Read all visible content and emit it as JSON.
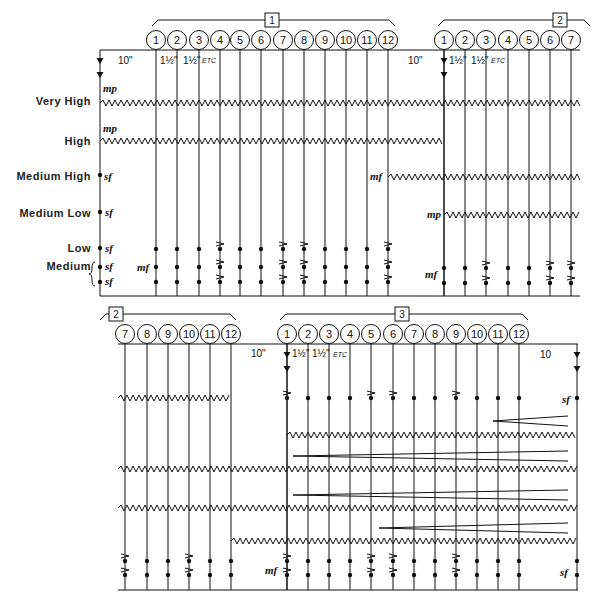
{
  "row_labels": [
    {
      "key": "very_high",
      "label": "Very High",
      "y": 101
    },
    {
      "key": "high",
      "label": "High",
      "y": 141
    },
    {
      "key": "medium_high",
      "label": "Medium High",
      "y": 176
    },
    {
      "key": "medium_low",
      "label": "Medium Low",
      "y": 213
    },
    {
      "key": "low",
      "label": "Low",
      "y": 248
    },
    {
      "key": "medium",
      "label": "Medium",
      "y": 266
    }
  ],
  "systems": [
    {
      "id": "top",
      "staff_top_y": 50,
      "staff_bottom_y": 296,
      "start_x": 100,
      "end_x": 580,
      "sections": [
        {
          "number": "1",
          "box_x": 272,
          "bracket_from": 152,
          "bracket_to": 395
        },
        {
          "number": "2",
          "box_x": 560,
          "bracket_from": 438,
          "bracket_to": 590
        }
      ],
      "events": [
        {
          "label": "1",
          "x": 156
        },
        {
          "label": "2",
          "x": 177
        },
        {
          "label": "3",
          "x": 199
        },
        {
          "label": "4",
          "x": 220
        },
        {
          "label": "5",
          "x": 240
        },
        {
          "label": "6",
          "x": 261
        },
        {
          "label": "7",
          "x": 283
        },
        {
          "label": "8",
          "x": 304
        },
        {
          "label": "9",
          "x": 325
        },
        {
          "label": "10",
          "x": 346
        },
        {
          "label": "11",
          "x": 367
        },
        {
          "label": "12",
          "x": 388
        },
        {
          "label": "1",
          "x": 444
        },
        {
          "label": "2",
          "x": 465
        },
        {
          "label": "3",
          "x": 486
        },
        {
          "label": "4",
          "x": 508
        },
        {
          "label": "5",
          "x": 529
        },
        {
          "label": "6",
          "x": 550
        },
        {
          "label": "7",
          "x": 571
        }
      ],
      "durations": [
        {
          "text": "10\"",
          "x": 118,
          "y": 64,
          "cls": "dur"
        },
        {
          "text": "1½\"",
          "x": 160,
          "y": 64,
          "cls": "dur"
        },
        {
          "text": "1½\"",
          "x": 183,
          "y": 64,
          "cls": "dur"
        },
        {
          "text": "ETC",
          "x": 202,
          "y": 63,
          "cls": "etc"
        },
        {
          "text": "10\"",
          "x": 408,
          "y": 64,
          "cls": "dur"
        },
        {
          "text": "1½\"",
          "x": 449,
          "y": 64,
          "cls": "dur"
        },
        {
          "text": "1½\"",
          "x": 471,
          "y": 64,
          "cls": "dur"
        },
        {
          "text": "ETC",
          "x": 491,
          "y": 63,
          "cls": "etc"
        }
      ],
      "arrows": [
        {
          "x": 100,
          "y1": 50,
          "y2": 80
        },
        {
          "x": 444,
          "y1": 50,
          "y2": 80
        }
      ],
      "dynamics": [
        {
          "text": "mp",
          "x": 103,
          "y": 92
        },
        {
          "text": "mp",
          "x": 103,
          "y": 132
        },
        {
          "text": "sf",
          "x": 104,
          "y": 180
        },
        {
          "text": "sf",
          "x": 105,
          "y": 216
        },
        {
          "text": "sf",
          "x": 105,
          "y": 252
        },
        {
          "text": "sf",
          "x": 105,
          "y": 270
        },
        {
          "text": "sf",
          "x": 105,
          "y": 285
        },
        {
          "text": "mf",
          "x": 137,
          "y": 271
        },
        {
          "text": "mf",
          "x": 370,
          "y": 180
        },
        {
          "text": "mp",
          "x": 427,
          "y": 218
        },
        {
          "text": "mf",
          "x": 425,
          "y": 278
        }
      ],
      "trills": [
        {
          "x1": 100,
          "x2": 580,
          "y": 103
        },
        {
          "x1": 100,
          "x2": 444,
          "y": 141
        },
        {
          "x1": 388,
          "x2": 580,
          "y": 177
        },
        {
          "x1": 444,
          "x2": 580,
          "y": 215
        }
      ],
      "dots": [
        {
          "x": 100,
          "y": 175
        },
        {
          "x": 100,
          "y": 212
        },
        {
          "x": 100,
          "y": 248
        },
        {
          "x": 100,
          "y": 267
        },
        {
          "x": 100,
          "y": 282
        }
      ],
      "event_dots": {
        "rows_y": [
          249,
          267,
          282
        ],
        "cols_x": [
          156,
          177,
          199,
          220,
          240,
          261,
          283,
          304,
          325,
          346,
          367,
          388
        ],
        "accent_cols": [
          220,
          283,
          304,
          388
        ]
      },
      "event_dots_2": {
        "rows_y": [
          268,
          283
        ],
        "cols_x": [
          444,
          465,
          486,
          508,
          529,
          550,
          571
        ],
        "accent_cols": [
          486,
          550,
          571
        ]
      },
      "left_brace_label": "Medium"
    },
    {
      "id": "bottom",
      "staff_top_y": 344,
      "staff_bottom_y": 590,
      "start_x": 118,
      "end_x": 578,
      "sections": [
        {
          "number": "2",
          "box_x": 116,
          "bracket_from": 100,
          "bracket_to": 236
        },
        {
          "number": "3",
          "box_x": 402,
          "bracket_from": 280,
          "bracket_to": 528
        }
      ],
      "events": [
        {
          "label": "7",
          "x": 125
        },
        {
          "label": "8",
          "x": 147
        },
        {
          "label": "9",
          "x": 168
        },
        {
          "label": "10",
          "x": 189
        },
        {
          "label": "11",
          "x": 210
        },
        {
          "label": "12",
          "x": 231
        },
        {
          "label": "1",
          "x": 287
        },
        {
          "label": "2",
          "x": 308
        },
        {
          "label": "3",
          "x": 329
        },
        {
          "label": "4",
          "x": 350
        },
        {
          "label": "5",
          "x": 371
        },
        {
          "label": "6",
          "x": 393
        },
        {
          "label": "7",
          "x": 414
        },
        {
          "label": "8",
          "x": 435
        },
        {
          "label": "9",
          "x": 456
        },
        {
          "label": "10",
          "x": 477
        },
        {
          "label": "11",
          "x": 498
        },
        {
          "label": "12",
          "x": 519
        }
      ],
      "durations": [
        {
          "text": "10\"",
          "x": 251,
          "y": 357,
          "cls": "dur"
        },
        {
          "text": "1½\"",
          "x": 292,
          "y": 357,
          "cls": "dur"
        },
        {
          "text": "1½\"",
          "x": 312,
          "y": 357,
          "cls": "dur"
        },
        {
          "text": "ETC",
          "x": 333,
          "y": 357,
          "cls": "etc"
        },
        {
          "text": "10",
          "x": 540,
          "y": 358,
          "cls": "dur"
        }
      ],
      "arrows": [
        {
          "x": 287,
          "y1": 344,
          "y2": 374
        },
        {
          "x": 577,
          "y1": 344,
          "y2": 374
        }
      ],
      "dynamics": [
        {
          "text": "sf",
          "x": 562,
          "y": 403
        },
        {
          "text": "mf",
          "x": 265,
          "y": 574
        },
        {
          "text": "sf",
          "x": 560,
          "y": 576
        }
      ],
      "trills": [
        {
          "x1": 118,
          "x2": 231,
          "y": 398
        },
        {
          "x1": 287,
          "x2": 577,
          "y": 435
        },
        {
          "x1": 118,
          "x2": 577,
          "y": 469
        },
        {
          "x1": 118,
          "x2": 577,
          "y": 508
        },
        {
          "x1": 231,
          "x2": 577,
          "y": 541
        }
      ],
      "hairpins": [
        {
          "x_tip": 493,
          "x_end": 568,
          "y": 421,
          "spread": 5
        },
        {
          "x_tip": 293,
          "x_end": 568,
          "y": 456,
          "spread": 5
        },
        {
          "x_tip": 293,
          "x_end": 568,
          "y": 495,
          "spread": 5
        },
        {
          "x_tip": 379,
          "x_end": 568,
          "y": 528,
          "spread": 5
        }
      ],
      "dots": [
        {
          "x": 577,
          "y": 398
        },
        {
          "x": 577,
          "y": 561
        },
        {
          "x": 577,
          "y": 575
        }
      ],
      "event_dots_a": {
        "rows_y": [
          561,
          575
        ],
        "cols_x": [
          125,
          147,
          168,
          189,
          210,
          231
        ],
        "accent_cols": [
          125,
          189
        ],
        "single_rows": {}
      },
      "event_dots_b_top": {
        "rows_y": [
          398
        ],
        "cols_x": [
          287,
          308,
          329,
          350,
          371,
          393,
          414,
          435,
          456,
          477,
          498,
          519
        ],
        "accent_cols": [
          287,
          371,
          393,
          456
        ]
      },
      "event_dots_b": {
        "rows_y": [
          561,
          575
        ],
        "cols_x": [
          287,
          308,
          329,
          350,
          371,
          393,
          414,
          435,
          456,
          477,
          498,
          519
        ],
        "accent_cols": [
          287,
          371,
          393,
          456
        ]
      }
    }
  ]
}
